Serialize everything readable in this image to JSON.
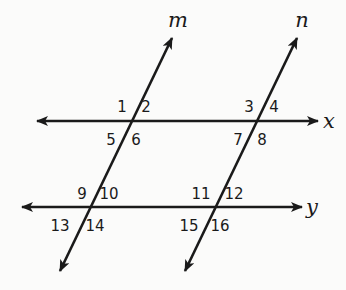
{
  "diagram": {
    "title": "",
    "transversals": [
      {
        "name": "m",
        "label": "m",
        "from": [
          60,
          271
        ],
        "to": [
          172,
          38
        ],
        "label_pos": [
          178,
          27
        ]
      },
      {
        "name": "n",
        "label": "n",
        "from": [
          185,
          271
        ],
        "to": [
          297,
          38
        ],
        "label_pos": [
          302,
          27
        ]
      }
    ],
    "parallel_lines": [
      {
        "name": "x",
        "label": "x",
        "from": [
          37,
          121
        ],
        "to": [
          318,
          121
        ],
        "label_pos": [
          329,
          128
        ]
      },
      {
        "name": "y",
        "label": "y",
        "from": [
          22,
          207
        ],
        "to": [
          302,
          207
        ],
        "label_pos": [
          312,
          214
        ]
      }
    ],
    "angles": [
      {
        "n": "1",
        "x": 122,
        "y": 112
      },
      {
        "n": "2",
        "x": 146,
        "y": 112
      },
      {
        "n": "3",
        "x": 249,
        "y": 112
      },
      {
        "n": "4",
        "x": 274,
        "y": 112
      },
      {
        "n": "5",
        "x": 111,
        "y": 145
      },
      {
        "n": "6",
        "x": 136,
        "y": 145
      },
      {
        "n": "7",
        "x": 238,
        "y": 145
      },
      {
        "n": "8",
        "x": 262,
        "y": 145
      },
      {
        "n": "9",
        "x": 82,
        "y": 199
      },
      {
        "n": "10",
        "x": 109,
        "y": 199
      },
      {
        "n": "11",
        "x": 201,
        "y": 199
      },
      {
        "n": "12",
        "x": 234,
        "y": 199
      },
      {
        "n": "13",
        "x": 60,
        "y": 231
      },
      {
        "n": "14",
        "x": 95,
        "y": 231
      },
      {
        "n": "15",
        "x": 189,
        "y": 231
      },
      {
        "n": "16",
        "x": 220,
        "y": 231
      }
    ]
  }
}
